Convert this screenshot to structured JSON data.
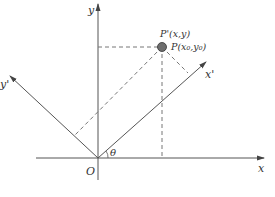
{
  "figure": {
    "type": "coordinate-rotation-diagram",
    "colors": {
      "axis": "#555555",
      "dashed": "#777777",
      "point_fill": "#6e6e6e",
      "point_stroke": "#333333",
      "text": "#333333"
    },
    "labels": {
      "x_axis": "x",
      "y_axis": "y",
      "x_prime_axis": "x'",
      "y_prime_axis": "y'",
      "origin": "O",
      "angle": "θ",
      "point_new": "P'(x,y)",
      "point_old": "P(x₀,y₀)"
    }
  }
}
